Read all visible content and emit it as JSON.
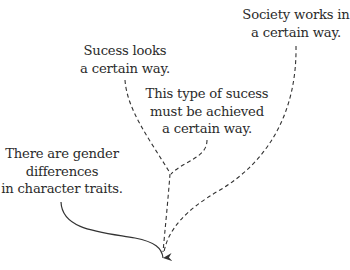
{
  "diagram": {
    "nodes": [
      {
        "id": "society",
        "lines": [
          "Society works in",
          "a certain way."
        ]
      },
      {
        "id": "success_looks",
        "lines": [
          "Sucess looks",
          "a certain way."
        ]
      },
      {
        "id": "success_achieved",
        "lines": [
          "This type of sucess",
          "must be achieved",
          "a certain way."
        ]
      },
      {
        "id": "gender",
        "lines": [
          "There are gender",
          "differences",
          "in character traits."
        ]
      }
    ],
    "edges": [
      {
        "from": "success_looks",
        "to": "junction",
        "style": "dashed"
      },
      {
        "from": "success_achieved",
        "to": "junction",
        "style": "dashed"
      },
      {
        "from": "junction",
        "to": "target",
        "style": "dashed"
      },
      {
        "from": "society",
        "to": "target",
        "style": "dashed"
      },
      {
        "from": "gender",
        "to": "target",
        "style": "solid",
        "arrow": true
      }
    ],
    "colors": {
      "text": "#2b2b2b",
      "line": "#333333"
    }
  }
}
